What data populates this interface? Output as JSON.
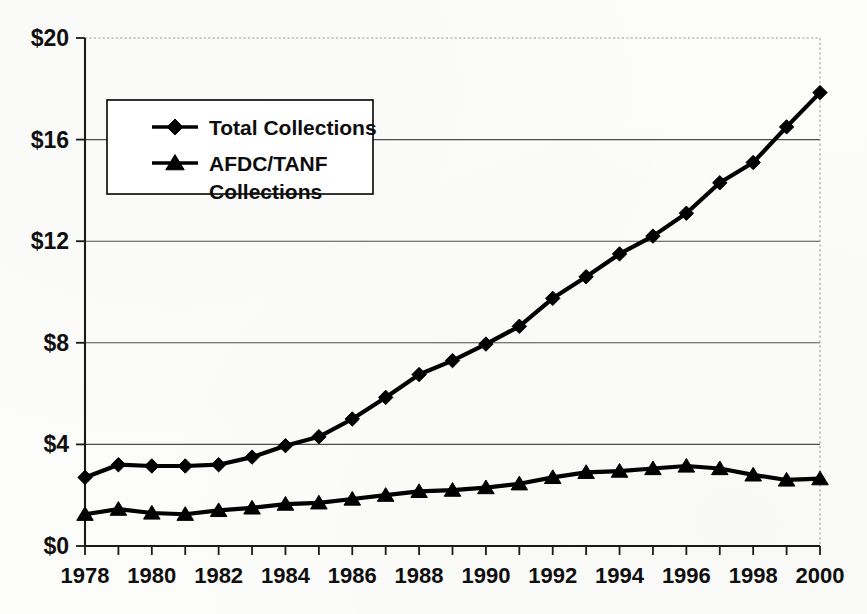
{
  "chart_data": {
    "type": "line",
    "title": "",
    "subtitle": "",
    "xlabel": "",
    "ylabel": "",
    "units": "billions of dollars",
    "x": [
      1978,
      1979,
      1980,
      1981,
      1982,
      1983,
      1984,
      1985,
      1986,
      1987,
      1988,
      1989,
      1990,
      1991,
      1992,
      1993,
      1994,
      1995,
      1996,
      1997,
      1998,
      1999,
      2000
    ],
    "categories": [
      "1978",
      "1979",
      "1980",
      "1981",
      "1982",
      "1983",
      "1984",
      "1985",
      "1986",
      "1987",
      "1988",
      "1989",
      "1990",
      "1991",
      "1992",
      "1993",
      "1994",
      "1995",
      "1996",
      "1997",
      "1998",
      "1999",
      "2000"
    ],
    "series": [
      {
        "name": "Total Collections",
        "marker": "diamond",
        "values": [
          2.7,
          3.2,
          3.15,
          3.15,
          3.2,
          3.5,
          3.95,
          4.3,
          5.0,
          5.85,
          6.75,
          7.3,
          7.95,
          8.65,
          9.75,
          10.6,
          11.5,
          12.2,
          13.1,
          14.3,
          15.1,
          16.5,
          17.85
        ]
      },
      {
        "name": "AFDC/TANF Collections",
        "marker": "triangle",
        "values": [
          1.25,
          1.45,
          1.3,
          1.25,
          1.4,
          1.5,
          1.65,
          1.7,
          1.85,
          2.0,
          2.15,
          2.2,
          2.3,
          2.45,
          2.7,
          2.9,
          2.95,
          3.05,
          3.15,
          3.05,
          2.8,
          2.6,
          2.65
        ]
      }
    ],
    "xlim": [
      1978,
      2000
    ],
    "ylim": [
      0,
      20
    ],
    "yticks": [
      0,
      4,
      8,
      12,
      16,
      20
    ],
    "ytick_labels": [
      "$0",
      "$4",
      "$8",
      "$12",
      "$16",
      "$20"
    ],
    "xtick_labels_shown": [
      "1978",
      "1980",
      "1982",
      "1984",
      "1986",
      "1988",
      "1990",
      "1992",
      "1994",
      "1996",
      "1998",
      "2000"
    ],
    "xtick_every": 1,
    "xlabel_every": 2,
    "grid": true,
    "grid_axis": "y",
    "legend": {
      "position": "upper-left-inside",
      "entries": [
        {
          "label": "Total Collections",
          "marker": "diamond"
        },
        {
          "label": "AFDC/TANF",
          "label_line2": "Collections",
          "marker": "triangle"
        }
      ]
    },
    "colors": {
      "series": "#000000",
      "grid": "#4c4c4c",
      "axis": "#1a1a1a",
      "background": "#fcfcfb",
      "text": "#0f0f0f"
    }
  }
}
